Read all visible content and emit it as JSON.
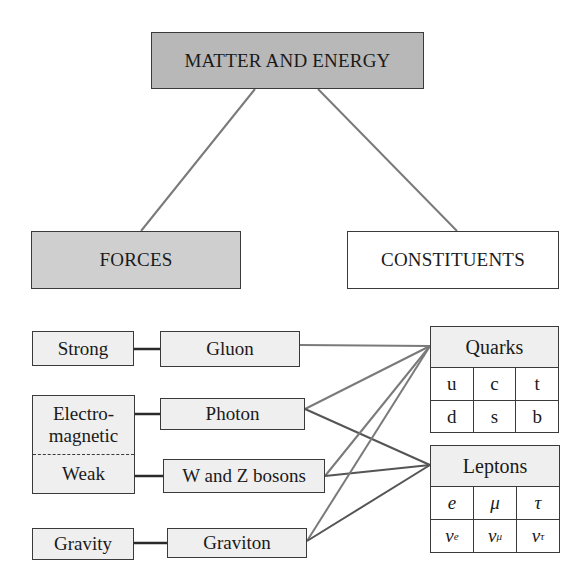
{
  "diagram": {
    "root": {
      "label": "MATTER AND ENERGY"
    },
    "categories": [
      {
        "label": "FORCES"
      },
      {
        "label": "CONSTITUENTS"
      }
    ],
    "forces": {
      "strong": "Strong",
      "electromagnetic": "Electro-\nmagnetic",
      "electromagnetic_line1": "Electro-",
      "electromagnetic_line2": "magnetic",
      "weak": "Weak",
      "gravity": "Gravity"
    },
    "carriers": {
      "gluon": "Gluon",
      "photon": "Photon",
      "wz": "W and Z bosons",
      "graviton": "Graviton"
    },
    "quarks": {
      "title": "Quarks",
      "rows": [
        [
          "u",
          "c",
          "t"
        ],
        [
          "d",
          "s",
          "b"
        ]
      ]
    },
    "leptons": {
      "title": "Leptons",
      "rows": [
        [
          "e",
          "μ",
          "τ"
        ],
        [
          "ν",
          "ν",
          "ν"
        ]
      ],
      "subscripts": [
        "e",
        "μ",
        "τ"
      ]
    },
    "connections": [
      {
        "from": "MATTER AND ENERGY",
        "to": "FORCES"
      },
      {
        "from": "MATTER AND ENERGY",
        "to": "CONSTITUENTS"
      },
      {
        "from": "Strong",
        "to": "Gluon"
      },
      {
        "from": "Electromagnetic",
        "to": "Photon"
      },
      {
        "from": "Weak",
        "to": "W and Z bosons"
      },
      {
        "from": "Gravity",
        "to": "Graviton"
      },
      {
        "from": "Gluon",
        "to": "Quarks"
      },
      {
        "from": "Photon",
        "to": "Quarks"
      },
      {
        "from": "Photon",
        "to": "Leptons"
      },
      {
        "from": "W and Z bosons",
        "to": "Quarks"
      },
      {
        "from": "W and Z bosons",
        "to": "Leptons"
      },
      {
        "from": "Graviton",
        "to": "Quarks"
      },
      {
        "from": "Graviton",
        "to": "Leptons"
      }
    ],
    "colors": {
      "root_fill": "#b8b8b8",
      "forces_fill": "#cfcfcf",
      "light_fill": "#efefef",
      "border": "#3a3a3a",
      "link_gray": "#7a7a7a",
      "link_dark": "#555555"
    }
  }
}
